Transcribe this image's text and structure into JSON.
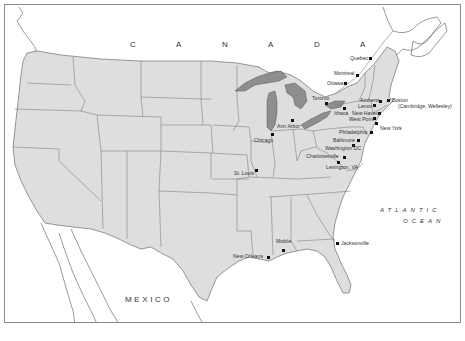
{
  "map": {
    "title": "",
    "colors": {
      "land_us": "#dedede",
      "land_border": "#6e6e6e",
      "lakes": "#8e8e8e",
      "water": "#ffffff",
      "frame": "#8a8a8a",
      "city_marker": "#111111",
      "text": "#333333"
    },
    "region_labels": {
      "canada": [
        "C",
        "A",
        "N",
        "A",
        "D",
        "A"
      ],
      "mexico": "MEXICO",
      "ocean_line1": "ATLANTIC",
      "ocean_line2": "OCEAN"
    },
    "cities": [
      {
        "name": "Quebec",
        "x": 369,
        "y": 57
      },
      {
        "name": "Montreal",
        "x": 356,
        "y": 73
      },
      {
        "name": "Ottawa",
        "x": 344,
        "y": 82
      },
      {
        "name": "Toronto",
        "x": 325,
        "y": 102
      },
      {
        "name": "Amherst",
        "x": 378,
        "y": 99
      },
      {
        "name": "Boston",
        "x": 386,
        "y": 99
      },
      {
        "name": "(Cambridge, Wellesley)",
        "x": null,
        "y": null
      },
      {
        "name": "Lenox",
        "x": 373,
        "y": 104
      },
      {
        "name": "Ithaca",
        "x": 342,
        "y": 106
      },
      {
        "name": "New Haven",
        "x": 377,
        "y": 111
      },
      {
        "name": "West Point",
        "x": 372,
        "y": 116
      },
      {
        "name": "New York",
        "x": 374,
        "y": 121
      },
      {
        "name": "Philadelphia",
        "x": 369,
        "y": 130
      },
      {
        "name": "Baltimore",
        "x": 356,
        "y": 138
      },
      {
        "name": "Washington DC",
        "x": 351,
        "y": 143
      },
      {
        "name": "Charlottesville",
        "x": 342,
        "y": 155
      },
      {
        "name": "Lexington, VA",
        "x": 336,
        "y": 160
      },
      {
        "name": "Ann Arbor",
        "x": 291,
        "y": 118
      },
      {
        "name": "Chicago",
        "x": 270,
        "y": 132
      },
      {
        "name": "St. Louis",
        "x": 254,
        "y": 168
      },
      {
        "name": "Mobile",
        "x": 281,
        "y": 248
      },
      {
        "name": "New Orleans",
        "x": 266,
        "y": 255
      },
      {
        "name": "Jacksonville",
        "x": 335,
        "y": 241
      }
    ]
  }
}
